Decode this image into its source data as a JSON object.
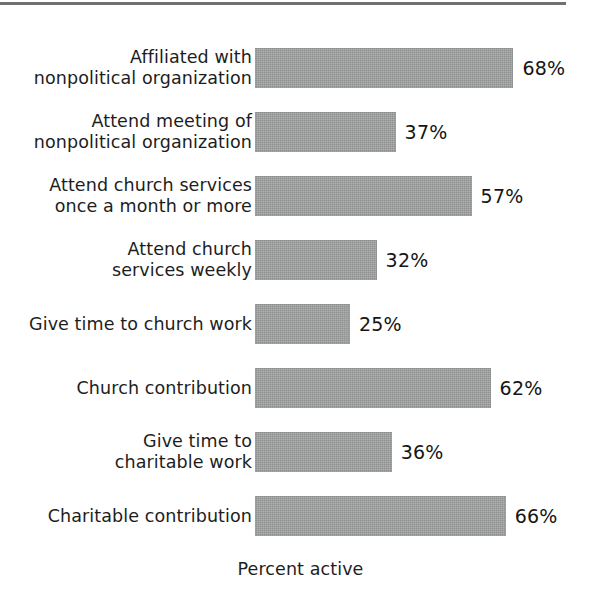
{
  "chart_data": {
    "type": "bar",
    "orientation": "horizontal",
    "title": "",
    "subtitle": "",
    "xlabel": "Percent active",
    "ylabel": "",
    "xlim": [
      0,
      100
    ],
    "grid": false,
    "legend": null,
    "value_suffix": "%",
    "bar_color": "#9a9b9b",
    "categories": [
      "Affiliated with\nnonpolitical organization",
      "Attend meeting of\nnonpolitical organization",
      "Attend church services\nonce a month or more",
      "Attend church\nservices weekly",
      "Give time to church work",
      "Church contribution",
      "Give time to\ncharitable work",
      "Charitable contribution"
    ],
    "values": [
      68,
      37,
      57,
      32,
      25,
      62,
      36,
      66
    ],
    "value_labels": [
      "68%",
      "37%",
      "57%",
      "32%",
      "25%",
      "62%",
      "36%",
      "66%"
    ],
    "bars": [
      {
        "label": "Affiliated with\nnonpolitical organization",
        "value": 68,
        "value_label": "68%"
      },
      {
        "label": "Attend meeting of\nnonpolitical organization",
        "value": 37,
        "value_label": "37%"
      },
      {
        "label": "Attend church services\nonce a month or more",
        "value": 57,
        "value_label": "57%"
      },
      {
        "label": "Attend church\nservices weekly",
        "value": 32,
        "value_label": "32%"
      },
      {
        "label": "Give time to church work",
        "value": 25,
        "value_label": "25%"
      },
      {
        "label": "Church contribution",
        "value": 62,
        "value_label": "62%"
      },
      {
        "label": "Give time to\ncharitable work",
        "value": 36,
        "value_label": "36%"
      },
      {
        "label": "Charitable contribution",
        "value": 66,
        "value_label": "66%"
      }
    ]
  },
  "axis": {
    "x_title": "Percent active"
  },
  "style": {
    "rule_color": "#6e7072",
    "bar_color": "#9a9b9b",
    "text_color": "#1d1d1d",
    "background": "#ffffff"
  },
  "layout": {
    "bar_origin_x": 255,
    "px_per_percent": 3.8,
    "first_row_top": 48,
    "row_pitch": 64,
    "bar_height": 40
  }
}
